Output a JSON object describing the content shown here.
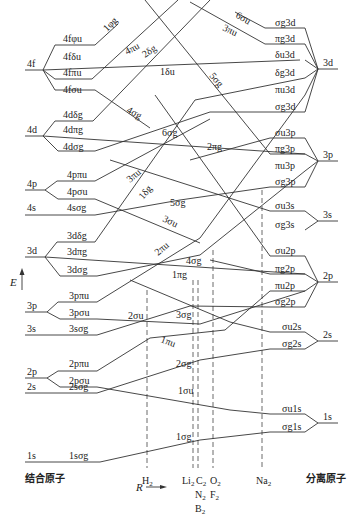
{
  "axis": {
    "energy_label": "E",
    "r_label": "R",
    "left_caption": "结合原子",
    "right_caption": "分离原子"
  },
  "united_atom_levels": [
    {
      "label": "4f",
      "y": 42,
      "components": [
        {
          "label": "4fφu",
          "y": 23
        },
        {
          "label": "4fδu",
          "y": 42
        },
        {
          "label": "4fπu",
          "y": 60
        },
        {
          "label": "4fσu",
          "y": 79
        }
      ]
    },
    {
      "label": "4d",
      "y": 132,
      "components": [
        {
          "label": "4dδg",
          "y": 117
        },
        {
          "label": "4dπg",
          "y": 132
        },
        {
          "label": "4dσg",
          "y": 148
        }
      ]
    },
    {
      "label": "4p",
      "y": 185,
      "components": [
        {
          "label": "4pπu",
          "y": 178
        },
        {
          "label": "4pσu",
          "y": 195
        }
      ]
    },
    {
      "label": "4s",
      "y": 214,
      "components": [
        {
          "label": "4sσg",
          "y": 214
        }
      ]
    },
    {
      "label": "3d",
      "y": 257,
      "components": [
        {
          "label": "3dδg",
          "y": 240
        },
        {
          "label": "3dπg",
          "y": 257
        },
        {
          "label": "3dσg",
          "y": 273
        }
      ]
    },
    {
      "label": "3p",
      "y": 310,
      "components": [
        {
          "label": "3pπu",
          "y": 302
        },
        {
          "label": "3pσu",
          "y": 319
        }
      ]
    },
    {
      "label": "3s",
      "y": 335,
      "components": [
        {
          "label": "3sσg",
          "y": 335
        }
      ]
    },
    {
      "label": "2p",
      "y": 380,
      "components": [
        {
          "label": "2pπu",
          "y": 370
        },
        {
          "label": "2pσu",
          "y": 387
        }
      ]
    },
    {
      "label": "2s",
      "y": 393,
      "components": [
        {
          "label": "2sσg",
          "y": 393
        }
      ]
    },
    {
      "label": "1s",
      "y": 462,
      "components": [
        {
          "label": "1sσg",
          "y": 462
        }
      ]
    }
  ],
  "separated_atom_levels": [
    {
      "label": "3d",
      "y": 69,
      "components": [
        {
          "label": "σg3d",
          "y": 28
        },
        {
          "label": "πg3d",
          "y": 44
        },
        {
          "label": "δu3d",
          "y": 60
        },
        {
          "label": "δg3d",
          "y": 78
        },
        {
          "label": "πu3d",
          "y": 95
        },
        {
          "label": "σg3d",
          "y": 112
        }
      ]
    },
    {
      "label": "3p",
      "y": 161,
      "components": [
        {
          "label": "σu3p",
          "y": 138
        },
        {
          "label": "πg3p",
          "y": 154
        },
        {
          "label": "πu3p",
          "y": 171
        },
        {
          "label": "σg3p",
          "y": 187
        }
      ]
    },
    {
      "label": "3s",
      "y": 221,
      "components": [
        {
          "label": "σu3s",
          "y": 211
        },
        {
          "label": "σg3s",
          "y": 230
        }
      ]
    },
    {
      "label": "2p",
      "y": 282,
      "components": [
        {
          "label": "σu2p",
          "y": 256
        },
        {
          "label": "πg2p",
          "y": 274
        },
        {
          "label": "πu2p",
          "y": 291
        },
        {
          "label": "σg2p",
          "y": 307
        }
      ]
    },
    {
      "label": "2s",
      "y": 341,
      "components": [
        {
          "label": "σu2s",
          "y": 332
        },
        {
          "label": "σg2s",
          "y": 349
        }
      ]
    },
    {
      "label": "1s",
      "y": 423,
      "components": [
        {
          "label": "σu1s",
          "y": 414
        },
        {
          "label": "σg1s",
          "y": 432
        }
      ]
    }
  ],
  "correlation_labels": [
    {
      "label": "1φg",
      "x": 112,
      "y": 20,
      "rot": -45
    },
    {
      "label": "4πu",
      "x": 124,
      "y": 52,
      "rot": -28
    },
    {
      "label": "2δg",
      "x": 148,
      "y": 54,
      "rot": -35
    },
    {
      "label": "1δu",
      "x": 162,
      "y": 74,
      "rot": 0
    },
    {
      "label": "4σg",
      "x": 128,
      "y": 119,
      "rot": 28
    },
    {
      "label": "5σg",
      "x": 208,
      "y": 88,
      "rot": 50
    },
    {
      "label": "6σu",
      "x": 237,
      "y": 24,
      "rot": 30
    },
    {
      "label": "3πu",
      "x": 222,
      "y": 36,
      "rot": 25
    },
    {
      "label": "6σg",
      "x": 160,
      "y": 135,
      "rot": 0
    },
    {
      "label": "2πg",
      "x": 207,
      "y": 148,
      "rot": 0
    },
    {
      "label": "3πu",
      "x": 128,
      "y": 174,
      "rot": -40
    },
    {
      "label": "1δg",
      "x": 137,
      "y": 193,
      "rot": -50
    },
    {
      "label": "5σg",
      "x": 170,
      "y": 200,
      "rot": 0
    },
    {
      "label": "3σu",
      "x": 162,
      "y": 222,
      "rot": 25
    },
    {
      "label": "2πu",
      "x": 155,
      "y": 249,
      "rot": -40
    },
    {
      "label": "4σg",
      "x": 186,
      "y": 263,
      "rot": 0
    },
    {
      "label": "1πg",
      "x": 172,
      "y": 278,
      "rot": 0
    },
    {
      "label": "2σu",
      "x": 128,
      "y": 318,
      "rot": 0
    },
    {
      "label": "3σg",
      "x": 176,
      "y": 318,
      "rot": 0
    },
    {
      "label": "1πu",
      "x": 161,
      "y": 346,
      "rot": 25
    },
    {
      "label": "2σg",
      "x": 176,
      "y": 366,
      "rot": 0
    },
    {
      "label": "1σu",
      "x": 176,
      "y": 394,
      "rot": 0
    },
    {
      "label": "1σg",
      "x": 176,
      "y": 440,
      "rot": 0
    }
  ],
  "molecules": [
    {
      "label": "H2",
      "x": 147,
      "y": 473
    },
    {
      "label": "Li2",
      "x": 192,
      "y": 473
    },
    {
      "label": "C2",
      "x": 200,
      "y": 473
    },
    {
      "label": "O2",
      "x": 214,
      "y": 473
    },
    {
      "label": "N2",
      "x": 200,
      "y": 487
    },
    {
      "label": "F2",
      "x": 214,
      "y": 487
    },
    {
      "label": "B2",
      "x": 200,
      "y": 501
    },
    {
      "label": "Na2",
      "x": 262,
      "y": 473
    }
  ]
}
